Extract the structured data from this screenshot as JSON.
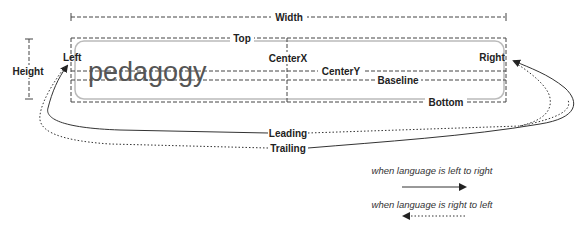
{
  "diagram": {
    "sample_word": "pedagogy",
    "labels": {
      "width": "Width",
      "height": "Height",
      "top": "Top",
      "bottom": "Bottom",
      "left": "Left",
      "right": "Right",
      "center_x": "CenterX",
      "center_y": "CenterY",
      "baseline": "Baseline",
      "leading": "Leading",
      "trailing": "Trailing"
    },
    "legend": [
      {
        "text": "when language is left to right",
        "line_style": "solid",
        "arrow_direction": "right"
      },
      {
        "text": "when language is right to left",
        "line_style": "dotted",
        "arrow_direction": "left"
      }
    ],
    "colors": {
      "line": "#333333",
      "guide_dash": "#444444",
      "rounded_box": "#bbbbbb",
      "word": "#555555"
    }
  }
}
